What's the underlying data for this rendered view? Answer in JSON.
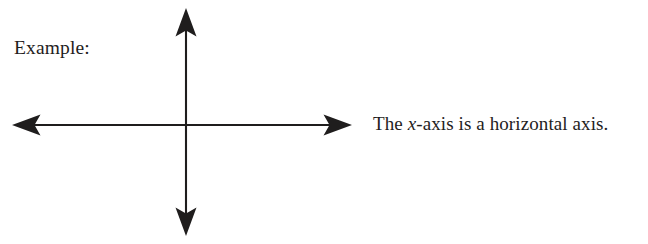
{
  "page": {
    "width": 648,
    "height": 244,
    "background_color": "#ffffff",
    "ink_color": "#1f1d1d"
  },
  "labels": {
    "example": "Example:"
  },
  "caption": {
    "before_variable": "The ",
    "variable": "x",
    "after_variable": "-axis is a horizontal axis.",
    "full_text": "The x-axis is a horizontal axis."
  },
  "diagram": {
    "name": "cartesian-axes",
    "origin": {
      "x": 186,
      "y": 125
    },
    "x_axis": {
      "label": "x-axis",
      "orientation": "horizontal",
      "start": {
        "x": 12,
        "y": 125
      },
      "end": {
        "x": 352,
        "y": 125
      },
      "arrowheads": [
        "left",
        "right"
      ],
      "stroke_width": 2,
      "color": "#1f1d1d"
    },
    "y_axis": {
      "label": "y-axis",
      "orientation": "vertical",
      "start": {
        "x": 186,
        "y": 8
      },
      "end": {
        "x": 186,
        "y": 236
      },
      "arrowheads": [
        "up",
        "down"
      ],
      "stroke_width": 2,
      "color": "#1f1d1d"
    }
  }
}
